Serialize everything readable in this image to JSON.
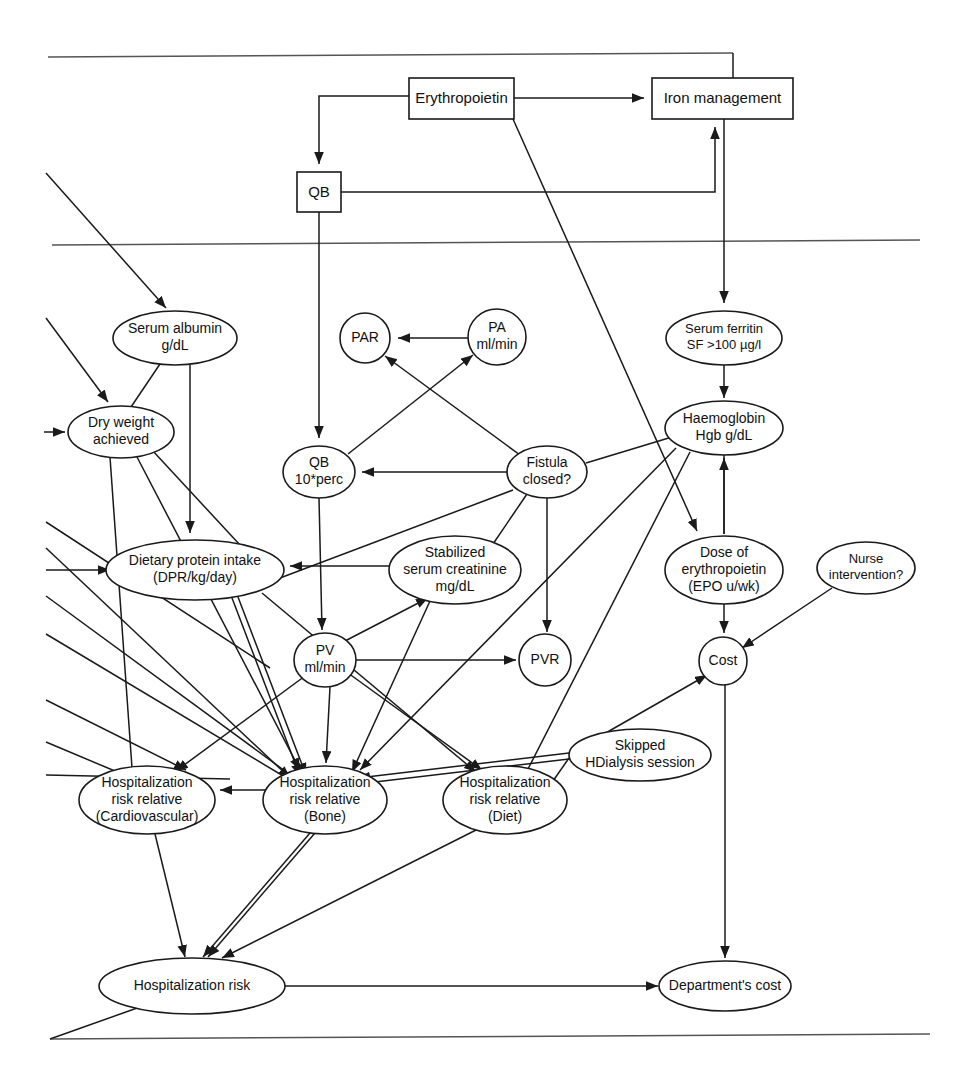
{
  "diagram": {
    "type": "influence-diagram",
    "canvas": {
      "width": 962,
      "height": 1083
    },
    "style": {
      "background": "#ffffff",
      "stroke": "#1a1a1a",
      "frame_stroke": "#555555",
      "text": "#111111"
    },
    "decision_nodes": [
      {
        "id": "erythropoietin",
        "shape": "rect",
        "label": "Erythropoietin",
        "x": 409,
        "y": 78,
        "w": 105,
        "h": 41,
        "font_size": 15
      },
      {
        "id": "iron-management",
        "shape": "rect",
        "label": "Iron management",
        "x": 652,
        "y": 78,
        "w": 141,
        "h": 41,
        "font_size": 15
      },
      {
        "id": "qb-decision",
        "shape": "rect",
        "label": "QB",
        "x": 297,
        "y": 172,
        "w": 44,
        "h": 40,
        "font_size": 15
      }
    ],
    "chance_nodes": [
      {
        "id": "serum-albumin",
        "shape": "ellipse",
        "lines": [
          "Serum albumin",
          "g/dL"
        ],
        "cx": 175,
        "cy": 338,
        "rx": 62,
        "ry": 27,
        "font_size": 14
      },
      {
        "id": "dry-weight-achieved",
        "shape": "ellipse",
        "lines": [
          "Dry weight",
          "achieved"
        ],
        "cx": 121,
        "cy": 432,
        "rx": 53,
        "ry": 26,
        "font_size": 14
      },
      {
        "id": "par",
        "shape": "ellipse",
        "lines": [
          "PAR"
        ],
        "cx": 365,
        "cy": 338,
        "rx": 25,
        "ry": 25,
        "font_size": 14
      },
      {
        "id": "pa-mlmin",
        "shape": "ellipse",
        "lines": [
          "PA",
          "ml/min"
        ],
        "cx": 497,
        "cy": 337,
        "rx": 29,
        "ry": 28,
        "font_size": 14
      },
      {
        "id": "serum-ferritin",
        "shape": "ellipse",
        "lines": [
          "Serum ferritin",
          "SF >100 µg/l"
        ],
        "cx": 724,
        "cy": 338,
        "rx": 58,
        "ry": 27,
        "font_size": 13
      },
      {
        "id": "qb-10perc",
        "shape": "ellipse",
        "lines": [
          "QB",
          "10*perc"
        ],
        "cx": 319,
        "cy": 472,
        "rx": 36,
        "ry": 26,
        "font_size": 14
      },
      {
        "id": "fistula-closed",
        "shape": "ellipse",
        "lines": [
          "Fistula",
          "closed?"
        ],
        "cx": 547,
        "cy": 472,
        "rx": 40,
        "ry": 26,
        "font_size": 14
      },
      {
        "id": "haemoglobin",
        "shape": "ellipse",
        "lines": [
          "Haemoglobin",
          "Hgb g/dL"
        ],
        "cx": 724,
        "cy": 428,
        "rx": 59,
        "ry": 27,
        "font_size": 14
      },
      {
        "id": "dietary-protein-intake",
        "shape": "ellipse",
        "lines": [
          "Dietary protein intake",
          "(DPR/kg/day)"
        ],
        "cx": 195,
        "cy": 570,
        "rx": 89,
        "ry": 30,
        "font_size": 14
      },
      {
        "id": "stabilized-serum-creatinine",
        "shape": "ellipse",
        "lines": [
          "Stabilized",
          "serum creatinine",
          "mg/dL"
        ],
        "cx": 455,
        "cy": 570,
        "rx": 66,
        "ry": 34,
        "font_size": 14
      },
      {
        "id": "dose-of-erythropoietin",
        "shape": "ellipse",
        "lines": [
          "Dose of",
          "erythropoietin",
          "(EPO u/wk)"
        ],
        "cx": 724,
        "cy": 570,
        "rx": 59,
        "ry": 34,
        "font_size": 14
      },
      {
        "id": "nurse-intervention",
        "shape": "ellipse",
        "lines": [
          "Nurse",
          "intervention?"
        ],
        "cx": 866,
        "cy": 568,
        "rx": 49,
        "ry": 26,
        "font_size": 13
      },
      {
        "id": "pv-mlmin",
        "shape": "ellipse",
        "lines": [
          "PV",
          "ml/min"
        ],
        "cx": 325,
        "cy": 660,
        "rx": 31,
        "ry": 27,
        "font_size": 14
      },
      {
        "id": "pvr",
        "shape": "ellipse",
        "lines": [
          "PVR"
        ],
        "cx": 545,
        "cy": 660,
        "rx": 26,
        "ry": 26,
        "font_size": 14
      },
      {
        "id": "cost",
        "shape": "ellipse",
        "lines": [
          "Cost"
        ],
        "cx": 723,
        "cy": 661,
        "rx": 24,
        "ry": 24,
        "font_size": 14
      },
      {
        "id": "skipped-hdialysis-session",
        "shape": "ellipse",
        "lines": [
          "Skipped",
          "HDialysis session"
        ],
        "cx": 640,
        "cy": 755,
        "rx": 71,
        "ry": 26,
        "font_size": 14
      },
      {
        "id": "hosp-risk-cardiovascular",
        "shape": "ellipse",
        "lines": [
          "Hospitalization",
          "risk relative",
          "(Cardiovascular)"
        ],
        "cx": 147,
        "cy": 800,
        "rx": 68,
        "ry": 34,
        "font_size": 14
      },
      {
        "id": "hosp-risk-bone",
        "shape": "ellipse",
        "lines": [
          "Hospitalization",
          "risk relative",
          "(Bone)"
        ],
        "cx": 325,
        "cy": 800,
        "rx": 62,
        "ry": 34,
        "font_size": 14
      },
      {
        "id": "hosp-risk-diet",
        "shape": "ellipse",
        "lines": [
          "Hospitalization",
          "risk relative",
          "(Diet)"
        ],
        "cx": 505,
        "cy": 800,
        "rx": 62,
        "ry": 34,
        "font_size": 14
      },
      {
        "id": "hospitalization-risk",
        "shape": "ellipse",
        "lines": [
          "Hospitalization risk"
        ],
        "cx": 192,
        "cy": 986,
        "rx": 93,
        "ry": 28,
        "font_size": 14
      },
      {
        "id": "departments-cost",
        "shape": "ellipse",
        "lines": [
          "Department's cost"
        ],
        "cx": 725,
        "cy": 986,
        "rx": 66,
        "ry": 25,
        "font_size": 14
      }
    ],
    "frame_lines": [
      {
        "name": "top-border-line",
        "points": "48,57 733,53"
      },
      {
        "name": "upper-divider-line",
        "points": "52,245 920,240"
      },
      {
        "name": "bottom-border-line",
        "points": "50,1039 930,1034"
      }
    ],
    "edges": [
      {
        "name": "iron-management-to-top-border",
        "path": "M 733,53 L 733,78",
        "arrow": false
      },
      {
        "name": "erythropoietin-to-qb-decision",
        "path": "M 409,96 L 319,96 L 319,164",
        "arrow": true
      },
      {
        "name": "erythropoietin-to-iron-management",
        "path": "M 514,98 L 644,98",
        "arrow": true
      },
      {
        "name": "qb-decision-to-iron-management",
        "path": "M 341,192 L 715,192 L 715,127",
        "arrow": true
      },
      {
        "name": "qb-decision-to-qb-10perc",
        "path": "M 319,212 L 319,438",
        "arrow": true
      },
      {
        "name": "erythropoietin-to-dose-of-erythropoietin",
        "path": "M 513,119 L 697,531",
        "arrow": true
      },
      {
        "name": "iron-management-to-serum-ferritin",
        "path": "M 724,119 L 724,303",
        "arrow": true
      },
      {
        "name": "offpage-to-serum-albumin",
        "path": "M 46,173 L 166,308",
        "arrow": true
      },
      {
        "name": "offpage-to-dry-weight",
        "path": "M 46,318 L 108,402",
        "arrow": true
      },
      {
        "name": "offpage-to-dry-weight-2",
        "path": "M 44,432 L 65,432",
        "arrow": true
      },
      {
        "name": "serum-albumin-to-dietary-protein",
        "path": "M 190,365 L 190,533",
        "arrow": true
      },
      {
        "name": "serum-albumin-to-dry-weight",
        "path": "M 160,364 L 131,407",
        "arrow": false
      },
      {
        "name": "dry-weight-to-dietary-protein",
        "path": "M 152,450 L 240,545",
        "arrow": false
      },
      {
        "name": "dry-weight-to-hosp-bone",
        "path": "M 137,457 L 300,770",
        "arrow": true
      },
      {
        "name": "dry-weight-to-hosp-cardio",
        "path": "M 110,457 L 132,768",
        "arrow": false
      },
      {
        "name": "pa-to-par",
        "path": "M 468,338 L 398,338",
        "arrow": true
      },
      {
        "name": "qb10perc-to-pa",
        "path": "M 348,454 L 473,355",
        "arrow": true
      },
      {
        "name": "fistula-to-par",
        "path": "M 520,455 L 385,356",
        "arrow": true
      },
      {
        "name": "fistula-to-qb10perc",
        "path": "M 507,472 L 362,472",
        "arrow": true
      },
      {
        "name": "fistula-to-pvr",
        "path": "M 547,498 L 547,632",
        "arrow": true
      },
      {
        "name": "fistula-to-haemoglobin",
        "path": "M 586,463 L 672,437",
        "arrow": false
      },
      {
        "name": "fistula-to-stabilized-creatinine",
        "path": "M 527,494 L 493,544",
        "arrow": false
      },
      {
        "name": "fistula-to-dietary-protein",
        "path": "M 513,490 L 280,578",
        "arrow": false
      },
      {
        "name": "serum-ferritin-to-haemoglobin",
        "path": "M 724,365 L 724,398",
        "arrow": true
      },
      {
        "name": "haemoglobin-to-dose-epo",
        "path": "M 724,455 L 724,534",
        "arrow": false
      },
      {
        "name": "dose-epo-to-haemoglobin",
        "path": "M 724,534 L 724,458",
        "arrow": true
      },
      {
        "name": "qb10perc-to-pv",
        "path": "M 319,498 L 322,630",
        "arrow": true
      },
      {
        "name": "stabilized-creatinine-to-dietary-protein",
        "path": "M 389,566 L 290,566",
        "arrow": true
      },
      {
        "name": "stabilized-creatinine-to-hosp-bone",
        "path": "M 430,601 L 352,772",
        "arrow": true
      },
      {
        "name": "pv-to-pvr",
        "path": "M 356,660 L 516,660",
        "arrow": true
      },
      {
        "name": "pv-to-stabilized-creatinine",
        "path": "M 345,641 L 428,598",
        "arrow": true
      },
      {
        "name": "pv-to-hosp-bone",
        "path": "M 330,687 L 326,763",
        "arrow": true
      },
      {
        "name": "pv-to-hosp-cardio",
        "path": "M 305,676 L 176,771",
        "arrow": true
      },
      {
        "name": "pv-to-hosp-diet",
        "path": "M 348,673 L 482,770",
        "arrow": true
      },
      {
        "name": "dose-epo-to-cost",
        "path": "M 724,604 L 724,633",
        "arrow": true
      },
      {
        "name": "nurse-intervention-to-cost",
        "path": "M 832,588 L 742,648",
        "arrow": true
      },
      {
        "name": "cost-to-departments-cost",
        "path": "M 725,685 L 725,958",
        "arrow": true
      },
      {
        "name": "skipped-to-cost",
        "path": "M 597,738 L 707,675",
        "arrow": true
      },
      {
        "name": "skipped-to-hosp-diet",
        "path": "M 569,758 L 553,781",
        "arrow": false
      },
      {
        "name": "skipped-to-hosp-bone-a",
        "path": "M 569,753 L 358,778",
        "arrow": true
      },
      {
        "name": "skipped-to-hosp-bone-b",
        "path": "M 569,759 L 358,784",
        "arrow": true
      },
      {
        "name": "offpage-left-to-hosp-cardio",
        "path": "M 46,775 L 230,779",
        "arrow": false
      },
      {
        "name": "offpage-left-line-a",
        "path": "M 46,522 L 270,668",
        "arrow": false
      },
      {
        "name": "offpage-left-line-b",
        "path": "M 46,548 L 290,778",
        "arrow": true
      },
      {
        "name": "offpage-left-line-c",
        "path": "M 46,570 L 110,570",
        "arrow": true
      },
      {
        "name": "offpage-left-line-d",
        "path": "M 46,596 L 300,782",
        "arrow": true
      },
      {
        "name": "offpage-left-line-e",
        "path": "M 46,634 L 300,786",
        "arrow": true
      },
      {
        "name": "offpage-left-line-f",
        "path": "M 46,700 L 186,770",
        "arrow": true
      },
      {
        "name": "offpage-left-line-g",
        "path": "M 46,742 L 122,774",
        "arrow": false
      },
      {
        "name": "dietary-protein-to-hosp-bone-a",
        "path": "M 232,598 L 300,776",
        "arrow": true
      },
      {
        "name": "dietary-protein-to-hosp-bone-b",
        "path": "M 238,597 L 306,775",
        "arrow": true
      },
      {
        "name": "dietary-protein-to-hosp-diet",
        "path": "M 262,593 L 476,772",
        "arrow": true
      },
      {
        "name": "haemoglobin-to-hosp-bone",
        "path": "M 676,448 L 360,770",
        "arrow": true
      },
      {
        "name": "haemoglobin-to-hosp-diet",
        "path": "M 690,452 L 528,769",
        "arrow": false
      },
      {
        "name": "hosp-bone-to-hosp-cardio",
        "path": "M 266,790 L 220,790",
        "arrow": true
      },
      {
        "name": "hosp-cardio-to-hospitalization-risk",
        "path": "M 155,834 L 185,957",
        "arrow": true
      },
      {
        "name": "hosp-bone-to-hospitalization-risk-a",
        "path": "M 310,833 L 203,957",
        "arrow": true
      },
      {
        "name": "hosp-bone-to-hospitalization-risk-b",
        "path": "M 315,833 L 208,957",
        "arrow": true
      },
      {
        "name": "hosp-diet-to-hospitalization-risk",
        "path": "M 480,828 L 222,958",
        "arrow": true
      },
      {
        "name": "hospitalization-risk-to-departments-cost",
        "path": "M 285,986 L 658,986",
        "arrow": true
      },
      {
        "name": "hospitalization-risk-to-bottom-border",
        "path": "M 140,1007 L 50,1039",
        "arrow": false
      }
    ]
  }
}
